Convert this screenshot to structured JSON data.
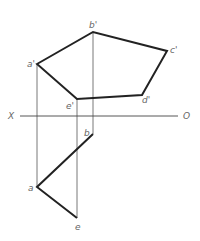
{
  "diagram": {
    "type": "orthographic-projection",
    "axis": {
      "left_label": "X",
      "right_label": "O"
    },
    "front_view": {
      "points": [
        {
          "label": "a'",
          "x": 37,
          "y": 64
        },
        {
          "label": "b'",
          "x": 93,
          "y": 32
        },
        {
          "label": "c'",
          "x": 167,
          "y": 51
        },
        {
          "label": "d'",
          "x": 142,
          "y": 95
        },
        {
          "label": "e'",
          "x": 77,
          "y": 99
        }
      ]
    },
    "top_view": {
      "points": [
        {
          "label": "b",
          "x": 93,
          "y": 134
        },
        {
          "label": "a",
          "x": 37,
          "y": 187
        },
        {
          "label": "e",
          "x": 77,
          "y": 218
        }
      ]
    },
    "colors": {
      "thick_line": "#222222",
      "thin_line": "#555555",
      "label": "#666666"
    }
  }
}
